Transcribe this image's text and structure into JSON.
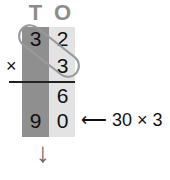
{
  "headers": {
    "tens": "T",
    "ones": "O"
  },
  "rows": {
    "multiplicand": {
      "tens": "3",
      "ones": "2"
    },
    "multiplier": {
      "sign": "×",
      "ones": "3"
    },
    "partial_1": {
      "ones": "6"
    },
    "partial_2": {
      "tens": "9",
      "ones": "0"
    }
  },
  "annotation": {
    "arrow": "⟵",
    "text": "30 × 3"
  },
  "down_arrow": "↓",
  "colors": {
    "tens_column": "#8f8f8f",
    "ones_column": "#e3e3e3",
    "header": "#8c8c8c"
  }
}
